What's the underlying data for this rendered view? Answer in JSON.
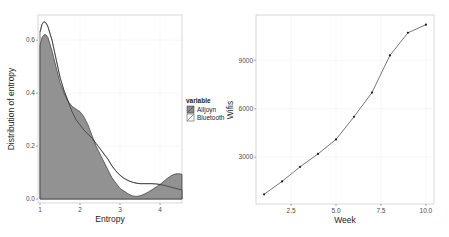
{
  "chart_data": [
    {
      "type": "area",
      "subtype": "density",
      "title": "",
      "xlabel": "Entropy",
      "ylabel": "Distribution of entropy",
      "xlim": [
        0.95,
        4.55
      ],
      "ylim": [
        -0.015,
        0.695
      ],
      "xticks": [
        1,
        2,
        3,
        4
      ],
      "xtick_labels": [
        "1",
        "2",
        "3",
        "4"
      ],
      "yticks": [
        0.0,
        0.2,
        0.4,
        0.6
      ],
      "ytick_labels": [
        "0.0",
        "0.2",
        "0.4",
        "0.6"
      ],
      "grid": true,
      "legend": {
        "title": "variable",
        "position": "right",
        "entries": [
          {
            "label": "Alljoyn",
            "fill": "#8c8c8c"
          },
          {
            "label": "Bluetooth",
            "fill": "#ffffff"
          }
        ]
      },
      "series": [
        {
          "name": "Alljoyn",
          "fill": "#8c8c8c",
          "x": [
            1.0,
            1.05,
            1.1,
            1.15,
            1.2,
            1.3,
            1.4,
            1.5,
            1.6,
            1.7,
            1.8,
            1.9,
            2.0,
            2.1,
            2.2,
            2.3,
            2.4,
            2.5,
            2.6,
            2.7,
            2.8,
            2.9,
            3.0,
            3.1,
            3.2,
            3.3,
            3.4,
            3.5,
            3.6,
            3.7,
            3.8,
            3.9,
            4.0,
            4.1,
            4.2,
            4.3,
            4.4,
            4.5,
            4.55
          ],
          "y": [
            0.58,
            0.61,
            0.62,
            0.62,
            0.61,
            0.56,
            0.5,
            0.44,
            0.4,
            0.37,
            0.35,
            0.34,
            0.33,
            0.31,
            0.28,
            0.24,
            0.2,
            0.17,
            0.14,
            0.11,
            0.08,
            0.06,
            0.04,
            0.03,
            0.02,
            0.012,
            0.01,
            0.012,
            0.018,
            0.026,
            0.035,
            0.045,
            0.055,
            0.068,
            0.08,
            0.09,
            0.095,
            0.095,
            0.093
          ]
        },
        {
          "name": "Bluetooth",
          "fill": "#ffffff",
          "x": [
            1.0,
            1.05,
            1.1,
            1.15,
            1.2,
            1.3,
            1.4,
            1.5,
            1.6,
            1.7,
            1.8,
            1.9,
            2.0,
            2.1,
            2.2,
            2.3,
            2.4,
            2.5,
            2.6,
            2.7,
            2.8,
            2.9,
            3.0,
            3.1,
            3.2,
            3.3,
            3.4,
            3.5,
            3.6,
            3.7,
            3.8,
            3.9,
            4.0,
            4.1,
            4.2,
            4.3,
            4.4,
            4.5,
            4.55
          ],
          "y": [
            0.63,
            0.66,
            0.67,
            0.665,
            0.65,
            0.6,
            0.53,
            0.46,
            0.41,
            0.37,
            0.33,
            0.3,
            0.28,
            0.26,
            0.245,
            0.23,
            0.21,
            0.19,
            0.17,
            0.15,
            0.125,
            0.105,
            0.09,
            0.078,
            0.07,
            0.064,
            0.06,
            0.058,
            0.058,
            0.058,
            0.058,
            0.057,
            0.055,
            0.052,
            0.048,
            0.044,
            0.04,
            0.036,
            0.034
          ]
        }
      ]
    },
    {
      "type": "line",
      "title": "",
      "xlabel": "Week",
      "ylabel": "Wifis",
      "xlim": [
        0.55,
        10.45
      ],
      "ylim": [
        100,
        11800
      ],
      "xticks": [
        2.5,
        5.0,
        7.5,
        10.0
      ],
      "xtick_labels": [
        "2.5",
        "5.0",
        "7.5",
        "10.0"
      ],
      "yticks": [
        3000,
        6000,
        9000
      ],
      "ytick_labels": [
        "3000",
        "6000",
        "9000"
      ],
      "grid": true,
      "series": [
        {
          "name": "Wifis",
          "color": "#1a1a1a",
          "marker": "point",
          "x": [
            1,
            2,
            3,
            4,
            5,
            6,
            7,
            8,
            9,
            10
          ],
          "y": [
            700,
            1500,
            2400,
            3200,
            4100,
            5500,
            7000,
            9300,
            10700,
            11200
          ]
        }
      ]
    }
  ]
}
